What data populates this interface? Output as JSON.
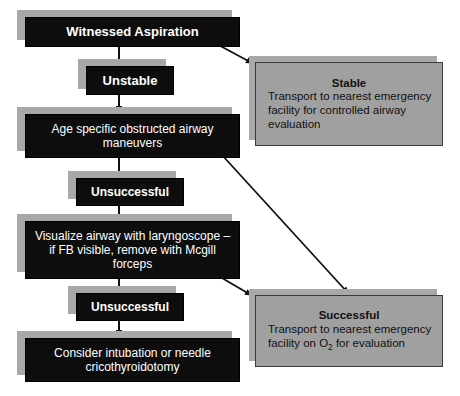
{
  "diagram": {
    "colors": {
      "dark_node_fill": "#0d0d0d",
      "dark_node_text": "#ffffff",
      "gray_node_fill": "#a0a0a0",
      "gray_node_border": "#3a3a3a",
      "shadow": "#a8a8a8",
      "connector": "#111111",
      "background": "#ffffff"
    },
    "nodes": {
      "witnessed_aspiration": {
        "label": "Witnessed Aspiration",
        "style": "dark"
      },
      "unstable": {
        "label": "Unstable",
        "style": "dark"
      },
      "age_specific": {
        "label": "Age specific obstructed airway maneuvers",
        "style": "dark"
      },
      "unsuccessful_1": {
        "label": "Unsuccessful",
        "style": "dark"
      },
      "visualize_airway": {
        "label": "Visualize airway with laryngoscope – if FB visible, remove with Mcgill forceps",
        "style": "dark"
      },
      "unsuccessful_2": {
        "label": "Unsuccessful",
        "style": "dark"
      },
      "consider_intubation": {
        "label": "Consider intubation or needle cricothyroidotomy",
        "style": "dark"
      },
      "stable": {
        "title": "Stable",
        "line1": "Transport to nearest emergency",
        "line2": "facility for controlled airway",
        "line3": "evaluation",
        "style": "gray"
      },
      "successful": {
        "title": "Successful",
        "line1": "Transport to nearest emergency",
        "line2_pre": "facility on O",
        "line2_sub": "2",
        "line2_post": " for evaluation",
        "style": "gray"
      }
    },
    "connectors": [
      {
        "name": "witnessed-to-unstable",
        "type": "vertical-arrow"
      },
      {
        "name": "unstable-to-age-specific",
        "type": "vertical-arrow"
      },
      {
        "name": "age-specific-to-unsuccessful-1",
        "type": "vertical-arrow"
      },
      {
        "name": "unsuccessful-1-to-visualize",
        "type": "vertical-arrow"
      },
      {
        "name": "visualize-to-unsuccessful-2",
        "type": "vertical-arrow"
      },
      {
        "name": "unsuccessful-2-to-consider",
        "type": "vertical-arrow"
      },
      {
        "name": "witnessed-to-stable",
        "type": "diagonal-arrow"
      },
      {
        "name": "age-specific-to-successful",
        "type": "diagonal-arrow"
      },
      {
        "name": "visualize-to-successful",
        "type": "diagonal-arrow"
      }
    ]
  }
}
